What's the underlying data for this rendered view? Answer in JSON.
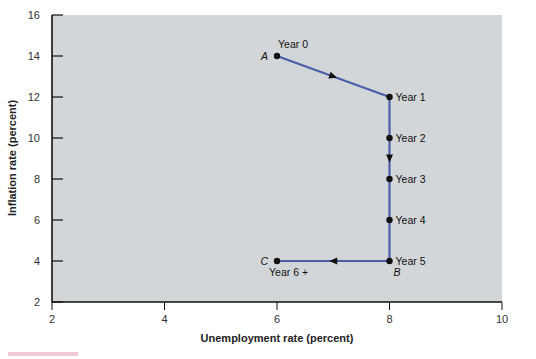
{
  "chart_data": {
    "type": "line",
    "title": "",
    "xlabel": "Unemployment rate (percent)",
    "ylabel": "Inflation rate (percent)",
    "xlim": [
      2,
      10
    ],
    "ylim": [
      2,
      16
    ],
    "x_ticks": [
      2,
      4,
      6,
      8,
      10
    ],
    "y_ticks": [
      2,
      4,
      6,
      8,
      10,
      12,
      14,
      16
    ],
    "grid": false,
    "plot_background": "#d3d6d8",
    "line_color": "#4a5fa8",
    "series": [
      {
        "name": "Disinflation path",
        "points": [
          {
            "x": 6,
            "y": 14,
            "label": "Year 0",
            "letter": "A"
          },
          {
            "x": 8,
            "y": 12,
            "label": "Year 1",
            "letter": ""
          },
          {
            "x": 8,
            "y": 10,
            "label": "Year 2",
            "letter": ""
          },
          {
            "x": 8,
            "y": 8,
            "label": "Year 3",
            "letter": ""
          },
          {
            "x": 8,
            "y": 6,
            "label": "Year 4",
            "letter": ""
          },
          {
            "x": 8,
            "y": 4,
            "label": "Year 5",
            "letter": "B"
          },
          {
            "x": 6,
            "y": 4,
            "label": "Year 6 +",
            "letter": "C"
          }
        ]
      }
    ]
  }
}
